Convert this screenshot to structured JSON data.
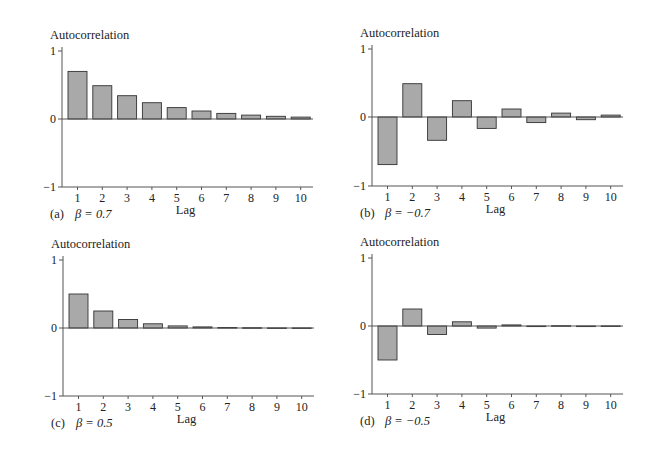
{
  "figure": {
    "ylabel": "Autocorrelation",
    "xlabel": "Lag",
    "colors": {
      "bar_fill": "#a9a9a9",
      "bar_stroke": "#333333",
      "axis": "#555555",
      "background": "#ffffff"
    }
  },
  "chart_data": [
    {
      "type": "bar",
      "panel": "(a)",
      "caption": "β = 0.7",
      "title": "",
      "xlabel": "Lag",
      "ylabel": "Autocorrelation",
      "categories": [
        "1",
        "2",
        "3",
        "4",
        "5",
        "6",
        "7",
        "8",
        "9",
        "10"
      ],
      "values": [
        0.7,
        0.49,
        0.343,
        0.24,
        0.168,
        0.118,
        0.082,
        0.058,
        0.04,
        0.028
      ],
      "ylim": [
        -1,
        1
      ],
      "yticks": [
        "1",
        "0",
        "−1"
      ],
      "grid": false
    },
    {
      "type": "bar",
      "panel": "(b)",
      "caption": "β = −0.7",
      "title": "",
      "xlabel": "Lag",
      "ylabel": "Autocorrelation",
      "categories": [
        "1",
        "2",
        "3",
        "4",
        "5",
        "6",
        "7",
        "8",
        "9",
        "10"
      ],
      "values": [
        -0.7,
        0.49,
        -0.343,
        0.24,
        -0.168,
        0.118,
        -0.082,
        0.058,
        -0.04,
        0.028
      ],
      "ylim": [
        -1,
        1
      ],
      "yticks": [
        "1",
        "0",
        "−1"
      ],
      "grid": false
    },
    {
      "type": "bar",
      "panel": "(c)",
      "caption": "β = 0.5",
      "title": "",
      "xlabel": "Lag",
      "ylabel": "Autocorrelation",
      "categories": [
        "1",
        "2",
        "3",
        "4",
        "5",
        "6",
        "7",
        "8",
        "9",
        "10"
      ],
      "values": [
        0.5,
        0.25,
        0.125,
        0.0625,
        0.031,
        0.016,
        0.008,
        0.004,
        0.002,
        0.001
      ],
      "ylim": [
        -1,
        1
      ],
      "yticks": [
        "1",
        "0",
        "−1"
      ],
      "grid": false
    },
    {
      "type": "bar",
      "panel": "(d)",
      "caption": "β = −0.5",
      "title": "",
      "xlabel": "Lag",
      "ylabel": "Autocorrelation",
      "categories": [
        "1",
        "2",
        "3",
        "4",
        "5",
        "6",
        "7",
        "8",
        "9",
        "10"
      ],
      "values": [
        -0.5,
        0.25,
        -0.125,
        0.0625,
        -0.031,
        0.016,
        -0.008,
        0.004,
        -0.002,
        0.001
      ],
      "ylim": [
        -1,
        1
      ],
      "yticks": [
        "1",
        "0",
        "−1"
      ],
      "grid": false
    }
  ]
}
